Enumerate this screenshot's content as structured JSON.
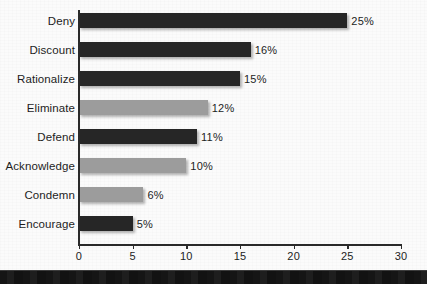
{
  "chart_data": {
    "type": "bar",
    "orientation": "horizontal",
    "title": "",
    "xlabel": "",
    "ylabel": "",
    "xlim": [
      0,
      30
    ],
    "grid": false,
    "legend": null,
    "categories": [
      "Deny",
      "Discount",
      "Rationalize",
      "Eliminate",
      "Defend",
      "Acknowledge",
      "Condemn",
      "Encourage"
    ],
    "values": [
      25,
      16,
      15,
      12,
      11,
      10,
      6,
      5
    ],
    "value_labels": [
      "25%",
      "16%",
      "15%",
      "12%",
      "11%",
      "10%",
      "6%",
      "5%"
    ],
    "bar_colors": [
      "#262626",
      "#262626",
      "#262626",
      "#9c9c9c",
      "#262626",
      "#9c9c9c",
      "#9c9c9c",
      "#262626"
    ],
    "xticks": [
      0,
      5,
      10,
      15,
      20,
      25,
      30
    ],
    "xtick_labels": [
      "0",
      "5",
      "10",
      "15",
      "20",
      "25",
      "30"
    ],
    "bars": [
      {
        "label": "Deny",
        "value": 25,
        "value_label": "25%",
        "color": "#262626",
        "shade": "dark"
      },
      {
        "label": "Discount",
        "value": 16,
        "value_label": "16%",
        "color": "#262626",
        "shade": "dark"
      },
      {
        "label": "Rationalize",
        "value": 15,
        "value_label": "15%",
        "color": "#262626",
        "shade": "dark"
      },
      {
        "label": "Eliminate",
        "value": 12,
        "value_label": "12%",
        "color": "#9c9c9c",
        "shade": "light"
      },
      {
        "label": "Defend",
        "value": 11,
        "value_label": "11%",
        "color": "#262626",
        "shade": "dark"
      },
      {
        "label": "Acknowledge",
        "value": 10,
        "value_label": "10%",
        "color": "#9c9c9c",
        "shade": "light"
      },
      {
        "label": "Condemn",
        "value": 6,
        "value_label": "6%",
        "color": "#9c9c9c",
        "shade": "light"
      },
      {
        "label": "Encourage",
        "value": 5,
        "value_label": "5%",
        "color": "#262626",
        "shade": "dark"
      }
    ]
  },
  "colors": {
    "bar_dark": "#262626",
    "bar_light": "#9c9c9c",
    "axis": "#2a2a2a",
    "text": "#1d1d1d",
    "background": "#fbfbfb",
    "bottom_band": "#171717"
  }
}
